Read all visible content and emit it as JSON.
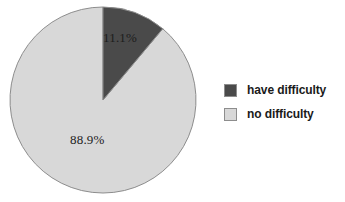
{
  "figure": {
    "background_color": "#ffffff",
    "width": 345,
    "height": 202
  },
  "chart_data": {
    "type": "pie",
    "title": "",
    "subtitle": "",
    "xlabel": "",
    "ylabel": "",
    "categories": [
      "have difficulty",
      "no difficulty"
    ],
    "values": [
      11.1,
      88.9
    ],
    "value_unit": "percent",
    "data_labels": [
      "11.1%",
      "88.9%"
    ],
    "colors": [
      "#4a4a4a",
      "#d8d8d8"
    ],
    "slice_border_color": "#8d8d8d",
    "start_angle_deg": 0,
    "direction": "clockwise",
    "legend": {
      "position": "right",
      "entries": [
        {
          "label": "have difficulty",
          "color": "#4a4a4a"
        },
        {
          "label": "no difficulty",
          "color": "#d8d8d8"
        }
      ]
    },
    "grid": false,
    "geometry": {
      "center_x": 103,
      "center_y": 100,
      "radius": 93
    }
  },
  "labels": {
    "have_difficulty_pct": "11.1%",
    "no_difficulty_pct": "88.9%"
  },
  "caption": {
    "clipped_line": ""
  }
}
